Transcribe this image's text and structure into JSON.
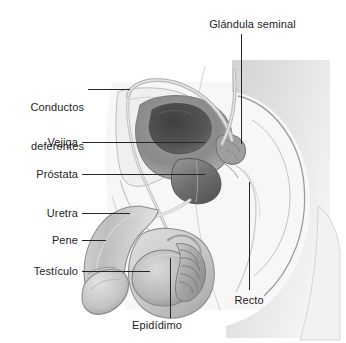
{
  "figure": {
    "background_color": "#ffffff",
    "text_color": "#242424",
    "leader_color": "#262626",
    "palette": {
      "skin_light": "#e9e9e9",
      "skin_mid": "#cfcfcf",
      "outline": "#8f8f8f",
      "organ_mid": "#a8a8a8",
      "organ_dark": "#5a5a5a",
      "bladder_cavity": "#4f4f4f",
      "prostate": "#7c7c7c",
      "tube": "#bdbdbd"
    }
  },
  "labels": [
    {
      "id": "glandula-seminal",
      "text": "Glándula seminal",
      "lines": [
        "Glándula seminal"
      ],
      "align": "center",
      "x": 190,
      "y": 18,
      "width": 125,
      "leader": {
        "type": "v",
        "x": 241,
        "y": 34,
        "length": 110
      }
    },
    {
      "id": "conductos-deferentes",
      "text": "Conductos deferentes",
      "lines": [
        "Conductos",
        "deferentes"
      ],
      "align": "right",
      "x": 6,
      "y": 75,
      "width": 78,
      "leader": {
        "type": "h",
        "x": 88,
        "y": 89,
        "length": 42
      }
    },
    {
      "id": "vejiga",
      "text": "Vejiga",
      "lines": [
        "Vejiga"
      ],
      "align": "right",
      "x": 14,
      "y": 136,
      "width": 64,
      "leader": {
        "type": "h",
        "x": 82,
        "y": 142,
        "length": 123
      }
    },
    {
      "id": "prostata",
      "text": "Próstata",
      "lines": [
        "Próstata"
      ],
      "align": "right",
      "x": 12,
      "y": 168,
      "width": 66,
      "leader": {
        "type": "h",
        "x": 82,
        "y": 174,
        "length": 123
      }
    },
    {
      "id": "uretra",
      "text": "Uretra",
      "lines": [
        "Uretra"
      ],
      "align": "right",
      "x": 14,
      "y": 207,
      "width": 64,
      "leader": {
        "type": "h",
        "x": 82,
        "y": 213,
        "length": 48
      }
    },
    {
      "id": "pene",
      "text": "Pene",
      "lines": [
        "Pene"
      ],
      "align": "right",
      "x": 18,
      "y": 234,
      "width": 60,
      "leader": {
        "type": "h",
        "x": 82,
        "y": 240,
        "length": 24
      }
    },
    {
      "id": "testiculo",
      "text": "Testículo",
      "lines": [
        "Testículo"
      ],
      "align": "right",
      "x": 10,
      "y": 265,
      "width": 68,
      "leader": {
        "type": "h",
        "x": 82,
        "y": 271,
        "length": 68
      }
    },
    {
      "id": "epididimo",
      "text": "Epidídimo",
      "lines": [
        "Epidídimo"
      ],
      "align": "center",
      "x": 118,
      "y": 319,
      "width": 78,
      "leader": {
        "type": "v",
        "x": 170,
        "y": 258,
        "length": 60
      }
    },
    {
      "id": "recto",
      "text": "Recto",
      "lines": [
        "Recto"
      ],
      "align": "center",
      "x": 222,
      "y": 294,
      "width": 54,
      "leader": {
        "type": "v",
        "x": 249,
        "y": 182,
        "length": 108
      }
    }
  ]
}
